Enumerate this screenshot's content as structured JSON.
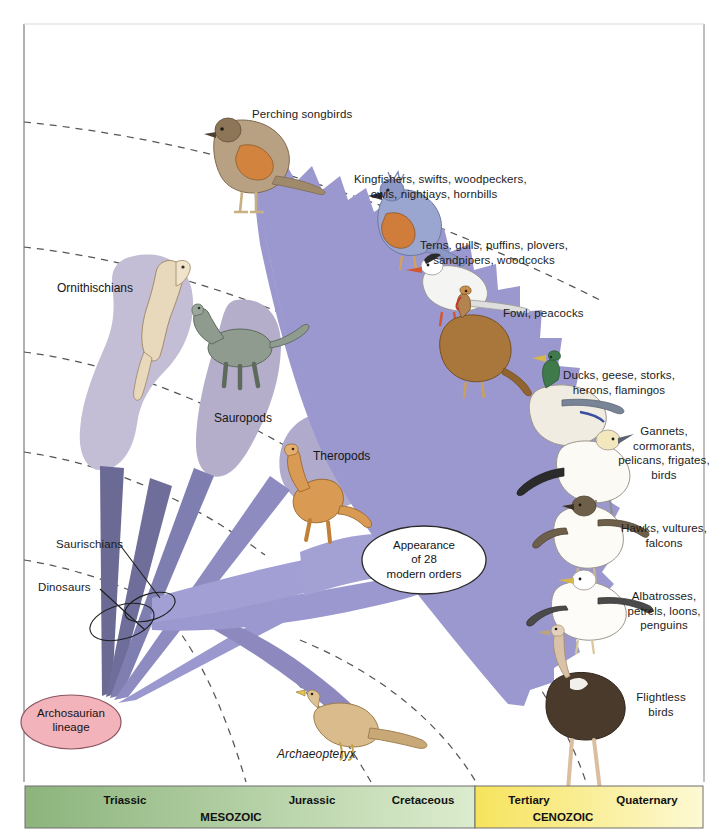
{
  "figure": {
    "type": "phylogenetic-fan-diagram"
  },
  "root_node": {
    "label": "Archosaurian\nlineage",
    "fill": "#f2b3bb",
    "stroke": "#8a5560"
  },
  "event_node": {
    "label": "Appearance\nof 28\nmodern orders",
    "fill": "#ffffff",
    "stroke": "#2a2a2a"
  },
  "clade_blobs": [
    {
      "name": "ornithischians",
      "label": "Ornithischians",
      "label_x": 57,
      "label_y": 281,
      "fill": "#c3bdd6"
    },
    {
      "name": "sauropods",
      "label": "Sauropods",
      "label_x": 214,
      "label_y": 411,
      "fill": "#b5aecb"
    },
    {
      "name": "theropods",
      "label": "Theropods",
      "label_x": 313,
      "label_y": 449,
      "fill": "#b0aacd"
    }
  ],
  "leader_labels": [
    {
      "name": "saurischians",
      "label": "Saurischians",
      "x": 56,
      "y": 537
    },
    {
      "name": "dinosaurs",
      "label": "Dinosaurs",
      "x": 38,
      "y": 580
    }
  ],
  "fossil_label": {
    "label": "Archaeopteryx",
    "x": 277,
    "y": 747
  },
  "bird_groups": [
    {
      "name": "perching-songbirds",
      "label": "Perching songbirds",
      "label_x": 252,
      "label_y": 107,
      "align": "left",
      "bird": "songbird"
    },
    {
      "name": "kingfishers-group",
      "label": "Kingfishers, swifts, woodpeckers,\nowls, nightjays, hornbills",
      "label_x": 434,
      "label_y": 172,
      "align": "center",
      "bird": "kingfisher"
    },
    {
      "name": "terns-group",
      "label": "Terns, gulls, puffins, plovers,\nsandpipers, woodcocks",
      "label_x": 494,
      "label_y": 238,
      "align": "center",
      "bird": "tern"
    },
    {
      "name": "fowl-group",
      "label": "Fowl, peacocks",
      "label_x": 503,
      "label_y": 306,
      "align": "left",
      "bird": "turkey"
    },
    {
      "name": "ducks-group",
      "label": "Ducks, geese, storks,\nherons, flamingos",
      "label_x": 619,
      "label_y": 368,
      "align": "center",
      "bird": "mallard"
    },
    {
      "name": "gannets-group",
      "label": "Gannets,\ncormorants,\npelicans, frigates,\nbirds",
      "label_x": 664,
      "label_y": 424,
      "align": "center",
      "bird": "gannet"
    },
    {
      "name": "hawks-group",
      "label": "Hawks, vultures,\nfalcons",
      "label_x": 664,
      "label_y": 521,
      "align": "center",
      "bird": "hawk"
    },
    {
      "name": "albatrosses-group",
      "label": "Albatrosses,\npetrels, loons,\npenguins",
      "label_x": 664,
      "label_y": 589,
      "align": "center",
      "bird": "albatross"
    },
    {
      "name": "flightless-group",
      "label": "Flightless\nbirds",
      "label_x": 660,
      "label_y": 690,
      "align": "center",
      "bird": "ostrich"
    }
  ],
  "timeline": {
    "eras": [
      {
        "name": "mesozoic",
        "label": "MESOZOIC",
        "start_x": 25,
        "end_x": 475,
        "fill_start": "#8cb47c",
        "fill_end": "#dbeccd"
      },
      {
        "name": "cenozoic",
        "label": "CENOZOIC",
        "start_x": 475,
        "end_x": 703,
        "fill_start": "#f5e25c",
        "fill_end": "#fdf8d2"
      }
    ],
    "periods": [
      {
        "name": "triassic",
        "label": "Triassic",
        "center_x": 125,
        "divider_x": 245
      },
      {
        "name": "jurassic",
        "label": "Jurassic",
        "center_x": 310,
        "divider_x": 370
      },
      {
        "name": "cretaceous",
        "label": "Cretaceous",
        "center_x": 420,
        "divider_x": 475
      },
      {
        "name": "tertiary",
        "label": "Tertiary",
        "center_x": 527,
        "divider_x": 585
      },
      {
        "name": "quaternary",
        "label": "Quaternary",
        "center_x": 645,
        "divider_x": null
      }
    ]
  },
  "colors": {
    "fan_main": "#9a98ce",
    "fan_light": "#a8a5d8",
    "lineage_dark": "#6b6a95",
    "lineage_mid": "#8281b4",
    "blob_purple": "#bdb7d2",
    "root_pink": "#f2b3bb",
    "dashed_grid": "#555555",
    "frame": "#aaaaaa"
  }
}
